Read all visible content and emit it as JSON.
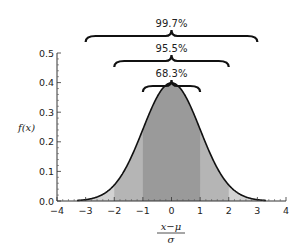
{
  "chart_data": {
    "type": "area",
    "title": "",
    "xlabel": "(x − μ) / σ",
    "xlabel_numerator": "x−μ",
    "xlabel_denominator": "σ",
    "ylabel": "f(x)",
    "xlim": [
      -4,
      4
    ],
    "ylim": [
      0,
      0.5
    ],
    "xticks": [
      "−4",
      "−3",
      "−2",
      "−1",
      "0",
      "1",
      "2",
      "3",
      "4"
    ],
    "yticks": [
      "0.0",
      "0.1",
      "0.2",
      "0.3",
      "0.4",
      "0.5"
    ],
    "grid": false,
    "curve": "standard normal density f(x) = (1/√(2π)) e^(−x²/2)",
    "peak": {
      "x": 0,
      "y": 0.399
    },
    "shaded_regions": [
      {
        "range": [
          -1,
          1
        ],
        "label": "68.3%",
        "shade": "#9a9a9a"
      },
      {
        "range": [
          -2,
          2
        ],
        "label": "95.5%",
        "shade": "#b5b5b5"
      },
      {
        "range": [
          -3,
          3
        ],
        "label": "99.7%",
        "shade": "#d2d2d2"
      }
    ],
    "annotations": [
      "68.3%",
      "95.5%",
      "99.7%"
    ]
  },
  "colors": {
    "band1": "#9a9a9a",
    "band2": "#b5b5b5",
    "band3": "#d2d2d2",
    "curve": "#111111",
    "axis": "#333333"
  }
}
